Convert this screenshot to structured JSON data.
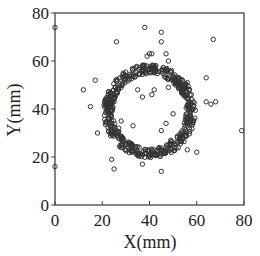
{
  "chart_data": {
    "type": "scatter",
    "title": "",
    "xlabel": "X(mm)",
    "ylabel": "Y(mm)",
    "xlim": [
      0,
      80
    ],
    "ylim": [
      0,
      80
    ],
    "xticks": [
      0,
      20,
      40,
      60,
      80
    ],
    "yticks": [
      0,
      20,
      40,
      60,
      80
    ],
    "grid": false,
    "legend": null,
    "marker": "open-circle",
    "ring": {
      "description": "dense ring of points",
      "center": [
        40,
        39
      ],
      "radius": 17.5,
      "thickness": 4
    },
    "outliers": [
      [
        0,
        74
      ],
      [
        0,
        16
      ],
      [
        79,
        31
      ],
      [
        38,
        74
      ],
      [
        45,
        72
      ],
      [
        45,
        68
      ],
      [
        26,
        68
      ],
      [
        67,
        69
      ],
      [
        12,
        48
      ],
      [
        17,
        52
      ],
      [
        15,
        41
      ],
      [
        47,
        63
      ],
      [
        39,
        62
      ],
      [
        40,
        63
      ],
      [
        41,
        63
      ],
      [
        48,
        60
      ],
      [
        64,
        53
      ],
      [
        56,
        51
      ],
      [
        42,
        48
      ],
      [
        35,
        48
      ],
      [
        48,
        49
      ],
      [
        54,
        47
      ],
      [
        37,
        45
      ],
      [
        41,
        46
      ],
      [
        28,
        35
      ],
      [
        27,
        32
      ],
      [
        26,
        30
      ],
      [
        33,
        33
      ],
      [
        47,
        34
      ],
      [
        45,
        31
      ],
      [
        64,
        43
      ],
      [
        66,
        42
      ],
      [
        68,
        43
      ],
      [
        49,
        27
      ],
      [
        52,
        26
      ],
      [
        60,
        22
      ],
      [
        25,
        15
      ],
      [
        37,
        17
      ],
      [
        45,
        14
      ],
      [
        18,
        30
      ],
      [
        24,
        19
      ],
      [
        30,
        25
      ],
      [
        56,
        23
      ],
      [
        22,
        40
      ],
      [
        50,
        38
      ]
    ]
  }
}
